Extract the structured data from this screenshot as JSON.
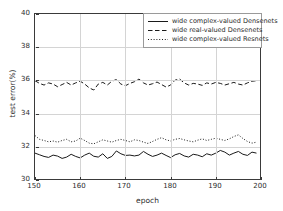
{
  "chart_data": {
    "type": "line",
    "title": "",
    "xlabel": "epoch",
    "ylabel": "test error(%)",
    "xlim": [
      150,
      200
    ],
    "ylim": [
      30,
      40
    ],
    "xticks": [
      150,
      160,
      170,
      180,
      190,
      200
    ],
    "yticks": [
      30,
      32,
      34,
      36,
      38,
      40
    ],
    "xticklabels": [
      "150",
      "160",
      "170",
      "180",
      "190",
      "200"
    ],
    "yticklabels": [
      "30",
      "32",
      "34",
      "36",
      "38",
      "40"
    ],
    "grid": true,
    "legend_position": "upper right",
    "x": [
      150,
      151,
      152,
      153,
      154,
      155,
      156,
      157,
      158,
      159,
      160,
      161,
      162,
      163,
      164,
      165,
      166,
      167,
      168,
      169,
      170,
      171,
      172,
      173,
      174,
      175,
      176,
      177,
      178,
      179,
      180,
      181,
      182,
      183,
      184,
      185,
      186,
      187,
      188,
      189,
      190,
      191,
      192,
      193,
      194,
      195,
      196,
      197,
      198,
      199
    ],
    "series": [
      {
        "name": "wide complex-valued Densenets",
        "linestyle": "solid",
        "color": "#1a1a1a",
        "values": [
          31.62,
          31.52,
          31.42,
          31.36,
          31.5,
          31.44,
          31.3,
          31.38,
          31.55,
          31.42,
          31.33,
          31.5,
          31.62,
          31.43,
          31.38,
          31.58,
          31.3,
          31.42,
          31.75,
          31.58,
          31.48,
          31.5,
          31.45,
          31.5,
          31.72,
          31.55,
          31.42,
          31.5,
          31.62,
          31.48,
          31.35,
          31.52,
          31.6,
          31.45,
          31.38,
          31.55,
          31.5,
          31.4,
          31.58,
          31.5,
          31.62,
          31.78,
          31.68,
          31.5,
          31.62,
          31.72,
          31.55,
          31.48,
          31.68,
          31.62
        ]
      },
      {
        "name": "wide real-valued Densenets",
        "linestyle": "dashed",
        "color": "#1a1a1a",
        "values": [
          35.98,
          35.82,
          35.72,
          35.85,
          35.78,
          35.62,
          35.75,
          35.88,
          35.72,
          35.85,
          35.95,
          35.78,
          35.55,
          35.42,
          35.78,
          35.88,
          35.72,
          35.95,
          36.05,
          35.78,
          35.68,
          35.82,
          35.92,
          36.08,
          35.85,
          35.72,
          35.8,
          35.9,
          35.75,
          35.6,
          35.72,
          36.02,
          36.08,
          35.85,
          35.72,
          35.82,
          35.78,
          35.7,
          35.85,
          35.78,
          35.88,
          35.82,
          35.72,
          35.8,
          35.88,
          35.78,
          35.72,
          35.85,
          35.95,
          35.98
        ]
      },
      {
        "name": "wide complex-valued Resnets",
        "linestyle": "dotted",
        "color": "#1a1a1a",
        "values": [
          32.68,
          32.45,
          32.38,
          32.3,
          32.35,
          32.28,
          32.38,
          32.45,
          32.3,
          32.35,
          32.52,
          32.38,
          32.22,
          32.18,
          32.3,
          32.42,
          32.35,
          32.28,
          32.38,
          32.45,
          32.38,
          32.3,
          32.42,
          32.38,
          32.28,
          32.2,
          32.32,
          32.45,
          32.55,
          32.42,
          32.35,
          32.45,
          32.5,
          32.42,
          32.35,
          32.3,
          32.4,
          32.48,
          32.38,
          32.45,
          32.52,
          32.45,
          32.38,
          32.48,
          32.62,
          32.72,
          32.5,
          32.32,
          32.22,
          32.28
        ]
      }
    ]
  }
}
